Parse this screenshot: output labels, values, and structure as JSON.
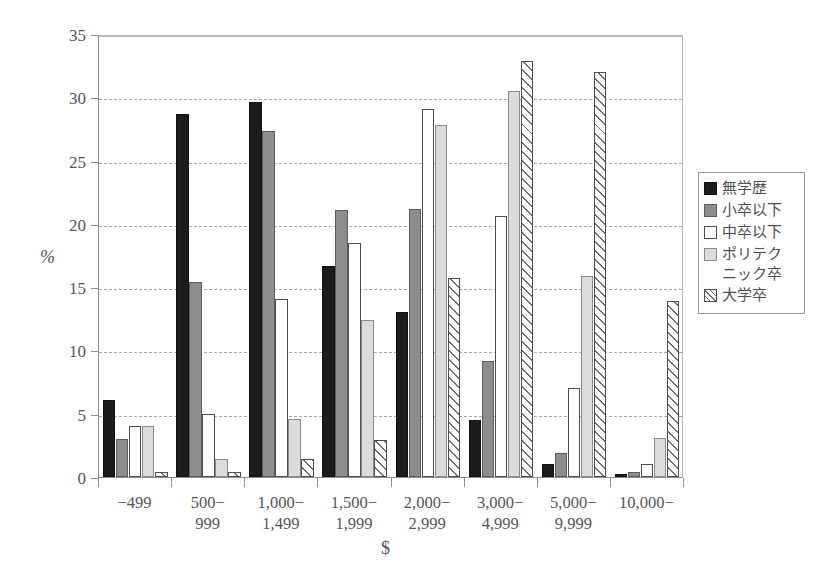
{
  "chart_data": {
    "type": "bar",
    "title": "",
    "xlabel": "$",
    "ylabel": "%",
    "ylim": [
      0,
      35
    ],
    "ytick_step": 5,
    "yticks": [
      "0",
      "5",
      "10",
      "15",
      "20",
      "25",
      "30",
      "35"
    ],
    "grid": true,
    "legend_position": "right",
    "categories": [
      "−499",
      "500−\n999",
      "1,000−\n1,499",
      "1,500−\n1,999",
      "2,000−\n2,999",
      "3,000−\n4,999",
      "5,000−\n9,999",
      "10,000−"
    ],
    "series": [
      {
        "name": "無学歴",
        "swatch": "black-solid",
        "values": [
          6.1,
          28.7,
          29.6,
          16.7,
          13.0,
          4.5,
          1.0,
          0.2
        ]
      },
      {
        "name": "小卒以下",
        "swatch": "gray-solid",
        "values": [
          3.0,
          15.4,
          27.3,
          21.1,
          21.2,
          9.2,
          1.9,
          0.4
        ]
      },
      {
        "name": "中卒以下",
        "swatch": "white-outline",
        "values": [
          4.0,
          5.0,
          14.1,
          18.5,
          29.1,
          20.6,
          7.0,
          1.0
        ]
      },
      {
        "name": "ポリテク\nニック卒",
        "swatch": "lightgray-solid",
        "values": [
          4.0,
          1.4,
          4.6,
          12.4,
          27.8,
          30.5,
          15.9,
          3.1
        ]
      },
      {
        "name": "大学卒",
        "swatch": "diagonal-hatch",
        "values": [
          0.4,
          0.4,
          1.4,
          2.9,
          15.7,
          32.9,
          32.0,
          13.9
        ]
      }
    ]
  }
}
